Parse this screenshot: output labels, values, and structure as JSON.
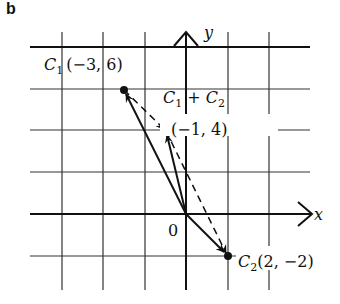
{
  "panel_label": "b",
  "axes": {
    "x_label": "x",
    "y_label": "y",
    "origin_label": "0"
  },
  "grid": {
    "x_lines": [
      62,
      103,
      145,
      228,
      269
    ],
    "y_lines": [
      89,
      130,
      172,
      256
    ],
    "origin_px": [
      186,
      214
    ],
    "unit_px": 20.75,
    "spacing_units": 2
  },
  "points": [
    {
      "name": "C1",
      "label_main": "C",
      "label_sub": "1",
      "coords": "(−3, 6)",
      "x": -3,
      "y": 6
    },
    {
      "name": "C1+C2",
      "label_text": "C",
      "label_sub1": "1",
      "plus": " + C",
      "label_sub2": "2",
      "coords": "(−1, 4)",
      "x": -1,
      "y": 4
    },
    {
      "name": "C2",
      "label_main": "C",
      "label_sub": "2",
      "coords": "(2, −2)",
      "x": 2,
      "y": -2
    }
  ],
  "colors": {
    "ink": "#111111",
    "grid": "#333333",
    "background": "#ffffff"
  }
}
